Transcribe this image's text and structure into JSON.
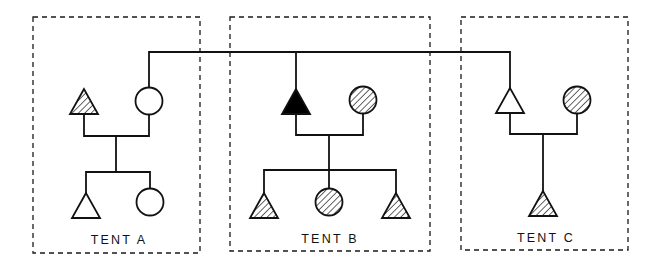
{
  "diagram": {
    "colors": {
      "line": "#111111",
      "background": "#ffffff",
      "filled": "#000000"
    },
    "legend_semantics": {
      "triangle": "male",
      "circle": "female",
      "fill_open": "unaffected",
      "fill_hatched": "hatched",
      "fill_solid": "solid black"
    },
    "tents": [
      {
        "id": "A",
        "label": "TENT A",
        "box": {
          "x": 33,
          "y": 17,
          "w": 167,
          "h": 236
        },
        "label_pos": {
          "x": 119,
          "y": 244
        }
      },
      {
        "id": "B",
        "label": "TENT B",
        "box": {
          "x": 230,
          "y": 17,
          "w": 200,
          "h": 234
        },
        "label_pos": {
          "x": 330,
          "y": 243
        }
      },
      {
        "id": "C",
        "label": "TENT C",
        "box": {
          "x": 461,
          "y": 17,
          "w": 167,
          "h": 233
        },
        "label_pos": {
          "x": 546,
          "y": 242
        }
      }
    ],
    "individuals": [
      {
        "id": "A-father",
        "tent": "A",
        "shape": "triangle",
        "fill": "hatched",
        "x": 84,
        "y": 102
      },
      {
        "id": "A-mother",
        "tent": "A",
        "shape": "circle",
        "fill": "open",
        "x": 149,
        "y": 101
      },
      {
        "id": "A-son",
        "tent": "A",
        "shape": "triangle",
        "fill": "open",
        "x": 86,
        "y": 206
      },
      {
        "id": "A-daughter",
        "tent": "A",
        "shape": "circle",
        "fill": "open",
        "x": 150,
        "y": 202
      },
      {
        "id": "B-father",
        "tent": "B",
        "shape": "triangle",
        "fill": "solid",
        "x": 296,
        "y": 102
      },
      {
        "id": "B-mother",
        "tent": "B",
        "shape": "circle",
        "fill": "hatched",
        "x": 363,
        "y": 100
      },
      {
        "id": "B-son-1",
        "tent": "B",
        "shape": "triangle",
        "fill": "hatched",
        "x": 264,
        "y": 206
      },
      {
        "id": "B-daughter",
        "tent": "B",
        "shape": "circle",
        "fill": "hatched",
        "x": 329,
        "y": 202
      },
      {
        "id": "B-son-2",
        "tent": "B",
        "shape": "triangle",
        "fill": "hatched",
        "x": 396,
        "y": 206
      },
      {
        "id": "C-father",
        "tent": "C",
        "shape": "triangle",
        "fill": "open",
        "x": 510,
        "y": 101
      },
      {
        "id": "C-mother",
        "tent": "C",
        "shape": "circle",
        "fill": "hatched",
        "x": 577,
        "y": 100
      },
      {
        "id": "C-son",
        "tent": "C",
        "shape": "triangle",
        "fill": "hatched",
        "x": 543,
        "y": 204
      }
    ],
    "connections": [
      {
        "type": "sibling-link",
        "from": "A-mother",
        "to": [
          "B-father",
          "C-father"
        ],
        "y": 52
      },
      {
        "type": "marriage",
        "tent": "A",
        "y": 136,
        "x1": 84,
        "x2": 149,
        "descent_x": 116
      },
      {
        "type": "children",
        "tent": "A",
        "y": 172,
        "x1": 86,
        "x2": 150
      },
      {
        "type": "marriage",
        "tent": "B",
        "y": 135,
        "x1": 296,
        "x2": 363,
        "descent_x": 329
      },
      {
        "type": "children",
        "tent": "B",
        "y": 170,
        "x1": 264,
        "x2": 396
      },
      {
        "type": "marriage",
        "tent": "C",
        "y": 134,
        "x1": 510,
        "x2": 577,
        "descent_x": 543
      }
    ]
  }
}
